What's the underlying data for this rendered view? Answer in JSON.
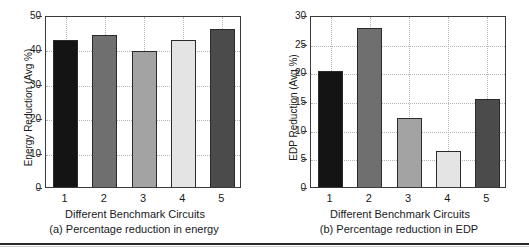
{
  "figure": {
    "bottom_rule": "",
    "bar_colors": [
      "#141414",
      "#6f6f6f",
      "#a3a3a3",
      "#e4e4e4",
      "#4b4b4b"
    ]
  },
  "chart_data": [
    {
      "type": "bar",
      "panel": "a",
      "title": "",
      "categories": [
        "1",
        "2",
        "3",
        "4",
        "5"
      ],
      "values": [
        42.6,
        44.2,
        39.5,
        42.6,
        45.8
      ],
      "xlabel": "Different Benchmark Circuits",
      "ylabel": "Energy Reduction (Avg %)",
      "caption": "(a) Percentage reduction in energy",
      "ylim": [
        0,
        50
      ],
      "yticks": [
        0,
        10,
        20,
        30,
        40,
        50
      ],
      "ytick_labels": [
        "0",
        "10",
        "20",
        "30",
        "40",
        "50"
      ],
      "grid": true,
      "legend": "none"
    },
    {
      "type": "bar",
      "panel": "b",
      "title": "",
      "categories": [
        "1",
        "2",
        "3",
        "4",
        "5"
      ],
      "values": [
        20.2,
        27.8,
        12.0,
        6.3,
        15.4
      ],
      "xlabel": "Different Benchmark Circuits",
      "ylabel": "EDP Reduction (Avg %)",
      "caption": "(b) Percentage reduction in EDP",
      "ylim": [
        0,
        30
      ],
      "yticks": [
        0,
        5,
        10,
        15,
        20,
        25,
        30
      ],
      "ytick_labels": [
        "0",
        "5",
        "10",
        "15",
        "20",
        "25",
        "30"
      ],
      "grid": true,
      "legend": "none"
    }
  ]
}
